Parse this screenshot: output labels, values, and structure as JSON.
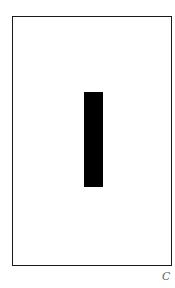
{
  "figure": {
    "label": "C",
    "frame_color": "#1a1a1a",
    "bar_color": "#000000",
    "label_color": "#666666"
  }
}
